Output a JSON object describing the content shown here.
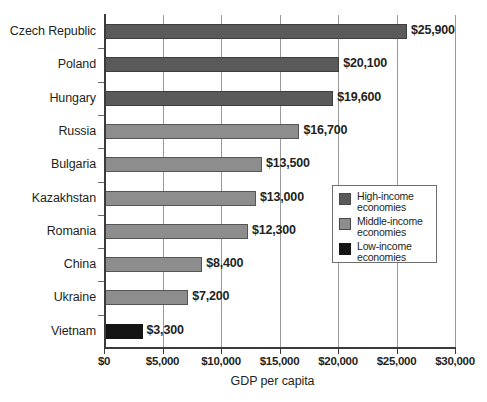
{
  "chart_data": {
    "type": "bar",
    "orientation": "horizontal",
    "title": "",
    "xlabel": "GDP per capita",
    "ylabel": "",
    "xlim": [
      0,
      30000
    ],
    "grid": "vertical",
    "legend_position": "inside-right",
    "categories": [
      "Czech Republic",
      "Poland",
      "Hungary",
      "Russia",
      "Bulgaria",
      "Kazakhstan",
      "Romania",
      "China",
      "Ukraine",
      "Vietnam"
    ],
    "values": [
      25900,
      20100,
      19600,
      16700,
      13500,
      13000,
      12300,
      8400,
      7200,
      3300
    ],
    "value_labels": [
      "$25,900",
      "$20,100",
      "$19,600",
      "$16,700",
      "$13,500",
      "$13,000",
      "$12,300",
      "$8,400",
      "$7,200",
      "$3,300"
    ],
    "groups": [
      "high",
      "high",
      "high",
      "middle",
      "middle",
      "middle",
      "middle",
      "middle",
      "middle",
      "low"
    ],
    "xticks": [
      0,
      5000,
      10000,
      15000,
      20000,
      25000,
      30000
    ],
    "xtick_labels": [
      "$0",
      "$5,000",
      "$10,000",
      "$15,000",
      "$20,000",
      "$25,000",
      "$30,000"
    ],
    "colors": {
      "high": "#5a5a5a",
      "middle": "#8d8d8d",
      "low": "#141414",
      "axis": "#3b3b3b",
      "gridline": "#9a9a9a",
      "text": "#231f20",
      "background": "#ffffff"
    },
    "legend": [
      {
        "key": "high",
        "label": "High-income\neconomies"
      },
      {
        "key": "middle",
        "label": "Middle-income\neconomies"
      },
      {
        "key": "low",
        "label": "Low-income\neconomies"
      }
    ]
  }
}
